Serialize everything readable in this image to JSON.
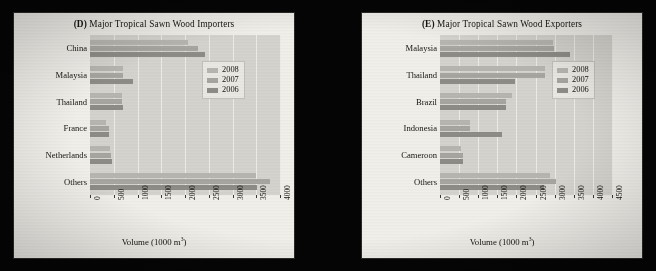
{
  "background_color": "#050505",
  "panel_color": "#f3f1ec",
  "plot_color": "#d7d5cf",
  "series_colors": {
    "2008": "#b9b7b1",
    "2007": "#a9a7a1",
    "2006": "#8f8d87"
  },
  "panels": [
    {
      "id": "D",
      "tag": "(D)",
      "title_text": " Major Tropical Sawn Wood Importers",
      "axis_title": "Volume (1000 m",
      "axis_title_sup": "3",
      "axis_title_end": ")",
      "legend": [
        "2008",
        "2007",
        "2006"
      ],
      "chart_data": {
        "type": "bar",
        "orientation": "horizontal",
        "title": "(D) Major Tropical Sawn Wood Importers",
        "xlabel": "Volume (1000 m3)",
        "ylabel": "",
        "xlim": [
          0,
          4000
        ],
        "xticks": [
          0,
          500,
          1000,
          1500,
          2000,
          2500,
          3000,
          3500,
          4000
        ],
        "grid": true,
        "legend_position": "right-upper",
        "categories": [
          "China",
          "Malaysia",
          "Thailand",
          "France",
          "Netherlands",
          "Others"
        ],
        "series": [
          {
            "name": "2008",
            "values": [
              2070,
              690,
              680,
              330,
              420,
              3500
            ]
          },
          {
            "name": "2007",
            "values": [
              2280,
              690,
              670,
              400,
              440,
              3790
            ]
          },
          {
            "name": "2006",
            "values": [
              2430,
              900,
              690,
              400,
              460,
              3520
            ]
          }
        ]
      }
    },
    {
      "id": "E",
      "tag": "(E)",
      "title_text": " Major Tropical Sawn Wood Exporters",
      "axis_title": "Volume (1000 m",
      "axis_title_sup": "3",
      "axis_title_end": ")",
      "legend": [
        "2008",
        "2007",
        "2006"
      ],
      "chart_data": {
        "type": "bar",
        "orientation": "horizontal",
        "title": "(E) Major Tropical Sawn Wood Exporters",
        "xlabel": "Volume (1000 m3)",
        "ylabel": "",
        "xlim": [
          0,
          4500
        ],
        "xticks": [
          0,
          500,
          1000,
          1500,
          2000,
          2500,
          3000,
          3500,
          4000,
          4500
        ],
        "grid": true,
        "legend_position": "right-upper",
        "categories": [
          "Malaysia",
          "Thailand",
          "Brazil",
          "Indonesia",
          "Cameroon",
          "Others"
        ],
        "series": [
          {
            "name": "2008",
            "values": [
              2950,
              2750,
              1880,
              780,
              540,
              2880
            ]
          },
          {
            "name": "2007",
            "values": [
              2970,
              2750,
              1730,
              780,
              590,
              3030
            ]
          },
          {
            "name": "2006",
            "values": [
              3410,
              1970,
              1730,
              1630,
              610,
              2710
            ]
          }
        ]
      }
    }
  ]
}
